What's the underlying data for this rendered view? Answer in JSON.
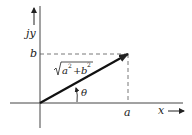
{
  "diagram": {
    "colors": {
      "ink": "#222222",
      "background": "#ffffff"
    },
    "axes": {
      "vertical_label": "jy",
      "horizontal_label": "x"
    },
    "point_labels": {
      "b": "b",
      "a": "a"
    },
    "vector": {
      "magnitude_label_radicand_a": "a",
      "magnitude_label_radicand_plus": "+",
      "magnitude_label_radicand_b": "b",
      "magnitude_label_exponent": "2",
      "angle_label": "θ"
    }
  }
}
